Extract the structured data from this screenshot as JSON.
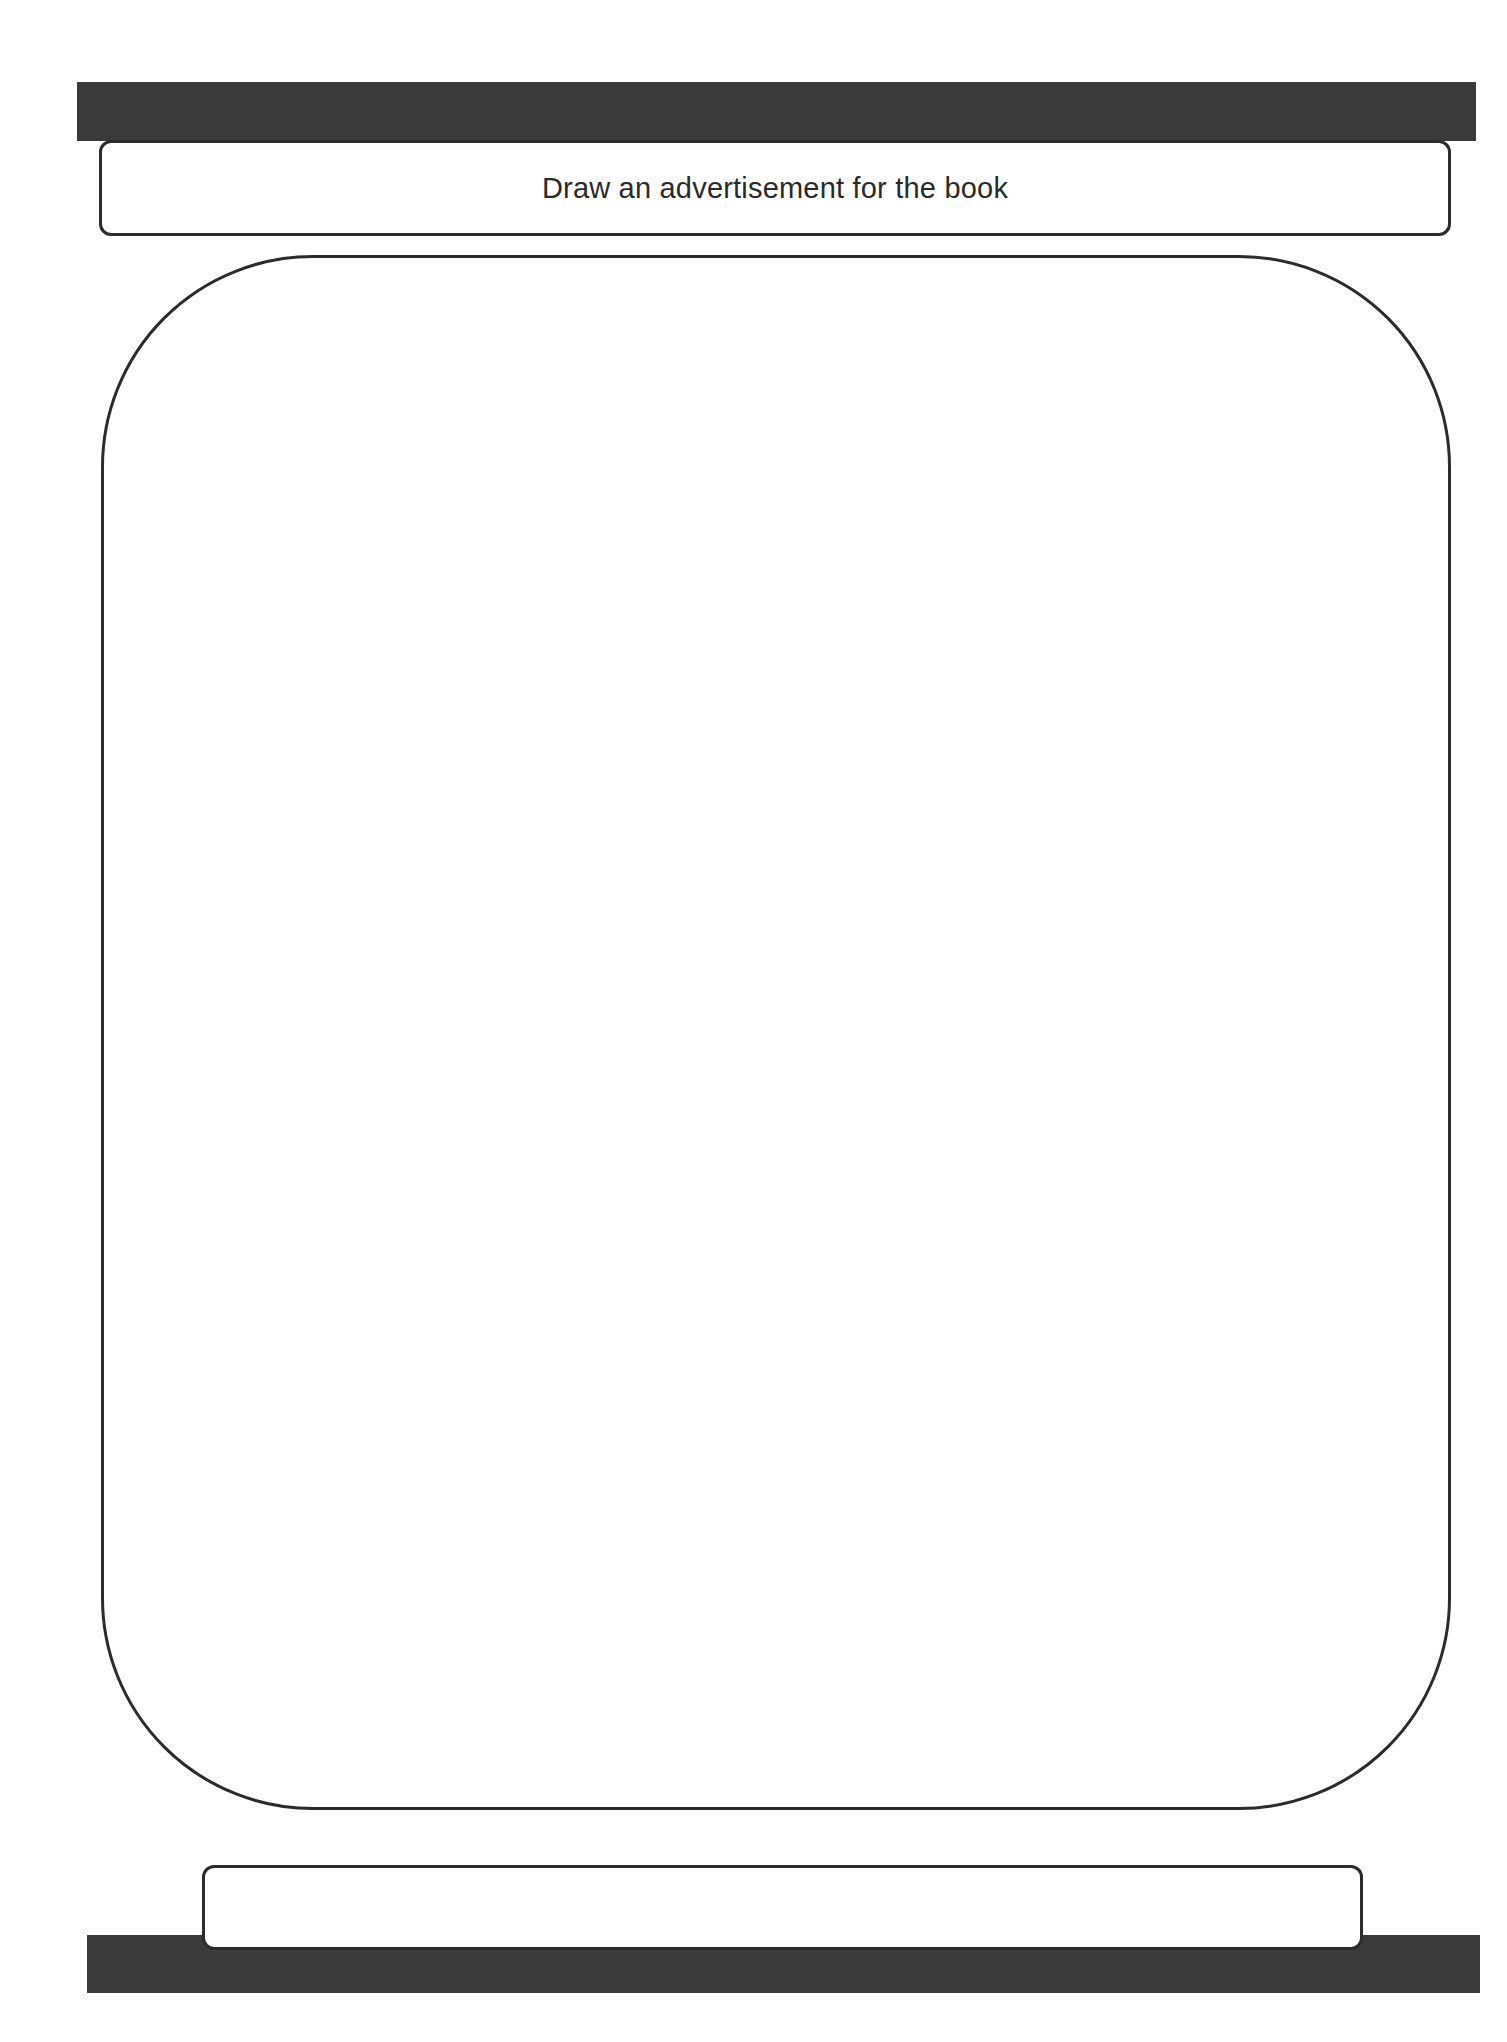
{
  "worksheet": {
    "title": "Draw an advertisement for the book",
    "drawing_area": {
      "content": ""
    },
    "caption_box": {
      "content": ""
    }
  },
  "colors": {
    "bar": "#3a3a3a",
    "border": "#2b2b2b",
    "background": "#ffffff",
    "text": "#2a2a2a"
  }
}
